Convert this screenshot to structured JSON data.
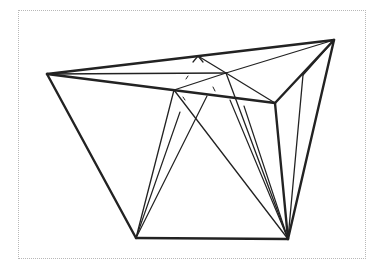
{
  "figure": {
    "frame": {
      "x": 18,
      "y": 10,
      "w": 348,
      "h": 249,
      "style": "dotted",
      "color": "#b8b8b8"
    },
    "stroke_color": "#222222",
    "vertices": {
      "A": [
        47,
        74
      ],
      "B": [
        334,
        40
      ],
      "C": [
        275,
        103
      ],
      "D": [
        136,
        238
      ],
      "E": [
        288,
        239
      ],
      "F": [
        226,
        73
      ],
      "G": [
        174,
        90
      ],
      "H": [
        198,
        56
      ],
      "R": [
        303,
        75
      ]
    },
    "outline_edges": [
      [
        "A",
        "B"
      ],
      [
        "A",
        "C"
      ],
      [
        "B",
        "C"
      ],
      [
        "A",
        "D"
      ],
      [
        "D",
        "E"
      ],
      [
        "C",
        "E"
      ],
      [
        "B",
        "E"
      ]
    ],
    "thin_edges": [
      [
        "A",
        "F"
      ],
      [
        "F",
        "B"
      ],
      [
        "F",
        "C"
      ],
      [
        "F",
        "G"
      ],
      [
        "H",
        "F"
      ],
      [
        "G",
        "D"
      ],
      [
        "G",
        "E"
      ],
      [
        "F",
        "E"
      ],
      [
        "R",
        "E"
      ],
      [
        "B",
        "R"
      ]
    ],
    "fan_lines": [
      {
        "from": [
          180,
          112
        ],
        "to": [
          136,
          238
        ]
      },
      {
        "from": [
          207,
          96
        ],
        "to": [
          136,
          238
        ]
      },
      {
        "from": [
          230,
          100
        ],
        "to": [
          288,
          239
        ]
      },
      {
        "from": [
          244,
          106
        ],
        "to": [
          288,
          239
        ]
      },
      {
        "from": [
          193,
          62
        ],
        "to": [
          198,
          56
        ]
      },
      {
        "from": [
          203,
          62
        ],
        "to": [
          198,
          56
        ]
      }
    ],
    "hatch_marks": [
      {
        "from": [
          186,
          79
        ],
        "to": [
          188,
          76
        ]
      },
      {
        "from": [
          213,
          87
        ],
        "to": [
          215,
          91
        ]
      },
      {
        "from": [
          183,
          97
        ],
        "to": [
          185,
          100
        ]
      }
    ]
  }
}
